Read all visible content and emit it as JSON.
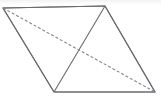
{
  "figure": {
    "canvas": {
      "width": 161,
      "height": 99,
      "background": "#ffffff"
    },
    "style": {
      "solid_stroke_color": "#6b6b70",
      "dashed_stroke_color": "#86868c",
      "stroke_width": 1.1,
      "dash_pattern": "3 2"
    },
    "vertices": {
      "top_left": {
        "label": "A",
        "x": 3,
        "y": 8
      },
      "top_right": {
        "label": "B",
        "x": 105,
        "y": 6
      },
      "bottom_right": {
        "label": "C",
        "x": 155,
        "y": 92
      },
      "bottom_left": {
        "label": "D",
        "x": 54,
        "y": 92
      }
    },
    "intersection": {
      "label": "O",
      "x": 78,
      "y": 52
    },
    "edges": [
      {
        "name": "top-edge",
        "from": "top_left",
        "to": "top_right",
        "style": "solid"
      },
      {
        "name": "right-edge",
        "from": "top_right",
        "to": "bottom_right",
        "style": "solid"
      },
      {
        "name": "bottom-edge",
        "from": "bottom_right",
        "to": "bottom_left",
        "style": "solid"
      },
      {
        "name": "left-edge",
        "from": "bottom_left",
        "to": "top_left",
        "style": "solid"
      }
    ],
    "diagonals": [
      {
        "name": "solid-diagonal",
        "from": "top_right",
        "to": "bottom_left",
        "style": "solid"
      },
      {
        "name": "dashed-diagonal",
        "from": "top_left",
        "to": "bottom_right",
        "style": "dashed"
      }
    ]
  }
}
